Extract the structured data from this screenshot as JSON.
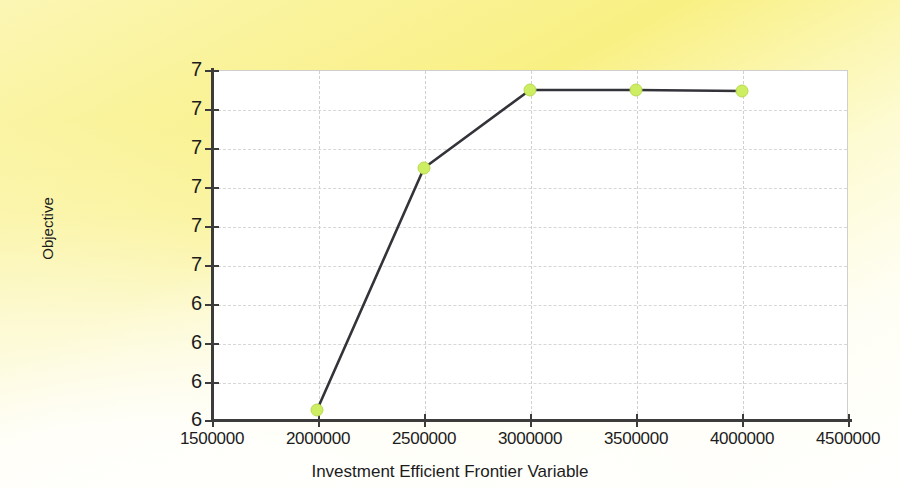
{
  "chart_data": {
    "type": "line",
    "title": "",
    "xlabel": "Investment Efficient Frontier Variable",
    "ylabel": "Objective",
    "xlim": [
      1500000,
      4500000
    ],
    "x_tick_labels": [
      "1500000",
      "2000000",
      "2500000",
      "3000000",
      "3500000",
      "4000000",
      "4500000"
    ],
    "x_ticks": [
      1500000,
      2000000,
      2500000,
      3000000,
      3500000,
      4000000,
      4500000
    ],
    "y_tick_labels": [
      "7",
      "7",
      "7",
      "7",
      "7",
      "7",
      "6",
      "6",
      "6",
      "6"
    ],
    "y_tick_positions_px": [
      70,
      109,
      148,
      187,
      226,
      265,
      304,
      343,
      382,
      420
    ],
    "grid": true,
    "grid_style": "dashed",
    "legend": null,
    "series": [
      {
        "name": "Objective",
        "marker": "circle",
        "marker_color": "#cdee63",
        "line_color": "#33333a",
        "x": [
          2000000,
          2500000,
          3000000,
          3500000,
          4000000
        ],
        "y_px": [
          410,
          168,
          90,
          90,
          91
        ],
        "points_px": [
          {
            "x": 317,
            "y": 410
          },
          {
            "x": 424,
            "y": 168
          },
          {
            "x": 530,
            "y": 90
          },
          {
            "x": 636,
            "y": 90
          },
          {
            "x": 742,
            "y": 91
          }
        ]
      }
    ]
  },
  "axes": {
    "x_title": "Investment Efficient Frontier Variable",
    "y_title": "Objective"
  },
  "colors": {
    "background_top": "#faf39c",
    "background_bottom": "#fffffd",
    "plot_background": "#ffffff",
    "axis": "#3c3c3c",
    "gridline": "#d7d7d7",
    "series_line": "#33333a",
    "series_marker": "#cdee63"
  }
}
